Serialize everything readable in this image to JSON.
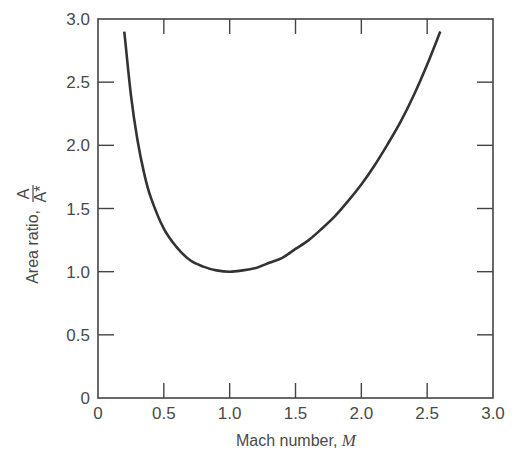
{
  "chart_data": {
    "type": "line",
    "title": "",
    "xlabel": "Mach number, M",
    "xlabel_text": "Mach number, ",
    "xlabel_var": "M",
    "ylabel": "Area ratio, A/A*",
    "ylabel_text": "Area ratio, ",
    "ylabel_num": "A",
    "ylabel_den": "A*",
    "xlim": [
      0,
      3.0
    ],
    "ylim": [
      0,
      3.0
    ],
    "x_ticks": [
      "0",
      "0.5",
      "1.0",
      "1.5",
      "2.0",
      "2.5",
      "3.0"
    ],
    "y_ticks": [
      "0",
      "0.5",
      "1.0",
      "1.5",
      "2.0",
      "2.5",
      "3.0"
    ],
    "grid": false,
    "legend": null,
    "series": [
      {
        "name": "A/A* (isentropic, γ = 1.4)",
        "color": "#333333",
        "x": [
          0.2,
          0.25,
          0.3,
          0.35,
          0.4,
          0.5,
          0.6,
          0.7,
          0.8,
          0.9,
          1.0,
          1.1,
          1.2,
          1.3,
          1.4,
          1.5,
          1.6,
          1.7,
          1.8,
          1.9,
          2.0,
          2.1,
          2.2,
          2.3,
          2.4,
          2.5,
          2.6
        ],
        "y": [
          2.96,
          2.4,
          2.04,
          1.78,
          1.59,
          1.34,
          1.19,
          1.09,
          1.04,
          1.01,
          1.0,
          1.01,
          1.03,
          1.07,
          1.11,
          1.18,
          1.25,
          1.34,
          1.44,
          1.56,
          1.69,
          1.84,
          2.01,
          2.19,
          2.4,
          2.64,
          2.9
        ]
      }
    ]
  }
}
